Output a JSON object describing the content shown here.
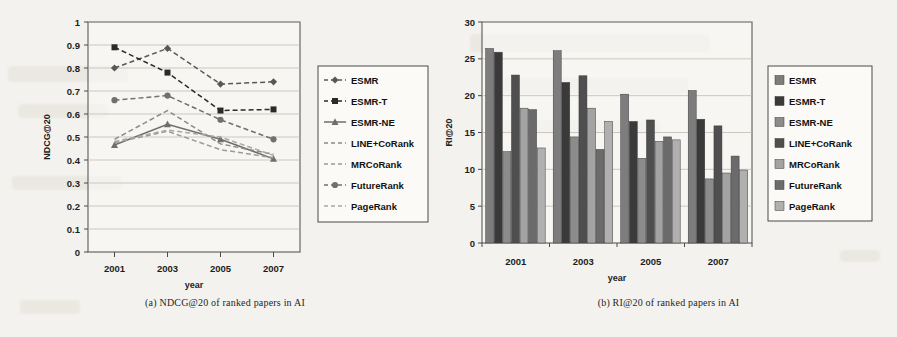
{
  "figure": {
    "panels": [
      {
        "id": "panel-a",
        "caption": "(a) NDCG@20  of ranked  papers in AI",
        "chart_ref": 0
      },
      {
        "id": "panel-b",
        "caption": "(b) RI@20  of ranked  papers in AI",
        "chart_ref": 1
      }
    ]
  },
  "chart_data": [
    {
      "type": "line",
      "title": "",
      "xlabel": "year",
      "ylabel": "NDCG@20",
      "categories": [
        "2001",
        "2003",
        "2005",
        "2007"
      ],
      "ylim": [
        0,
        1
      ],
      "yticks": [
        "0",
        "0.1",
        "0.2",
        "0.3",
        "0.4",
        "0.5",
        "0.6",
        "0.7",
        "0.8",
        "0.9",
        "1"
      ],
      "grid": true,
      "legend_position": "right",
      "series": [
        {
          "name": "ESMR",
          "values": [
            0.8,
            0.885,
            0.73,
            0.74
          ],
          "marker": "diamond",
          "dash": "dashed",
          "color": "#585858"
        },
        {
          "name": "ESMR-T",
          "values": [
            0.89,
            0.78,
            0.615,
            0.62
          ],
          "marker": "square",
          "dash": "dashed",
          "color": "#2a2a2a"
        },
        {
          "name": "ESMR-NE",
          "values": [
            0.465,
            0.555,
            0.49,
            0.405
          ],
          "marker": "triangle",
          "dash": "solid",
          "color": "#6e6e6e"
        },
        {
          "name": "LINE+CoRank",
          "values": [
            0.49,
            0.615,
            0.47,
            0.425
          ],
          "marker": "none",
          "dash": "dashed",
          "color": "#8a8a8a"
        },
        {
          "name": "MRCoRank",
          "values": [
            0.475,
            0.525,
            0.445,
            0.41
          ],
          "marker": "none",
          "dash": "dashed",
          "color": "#9b9b9b"
        },
        {
          "name": "FutureRank",
          "values": [
            0.66,
            0.68,
            0.575,
            0.49
          ],
          "marker": "circle",
          "dash": "dashed",
          "color": "#707070"
        },
        {
          "name": "PageRank",
          "values": [
            0.48,
            0.53,
            0.5,
            0.42
          ],
          "marker": "none",
          "dash": "dashed",
          "color": "#a8a8a8"
        }
      ]
    },
    {
      "type": "bar",
      "title": "",
      "xlabel": "year",
      "ylabel": "RI@20",
      "categories": [
        "2001",
        "2003",
        "2005",
        "2007"
      ],
      "ylim": [
        0,
        30
      ],
      "yticks": [
        "0",
        "5",
        "10",
        "15",
        "20",
        "25",
        "30"
      ],
      "grid": true,
      "legend_position": "right",
      "series": [
        {
          "name": "ESMR",
          "values": [
            26.4,
            26.1,
            20.2,
            20.7
          ],
          "color": "#7d7d7d"
        },
        {
          "name": "ESMR-T",
          "values": [
            25.9,
            21.8,
            16.5,
            16.8
          ],
          "color": "#3a3a3a"
        },
        {
          "name": "ESMR-NE",
          "values": [
            12.4,
            14.4,
            11.5,
            8.7
          ],
          "color": "#8c8c8c"
        },
        {
          "name": "LINE+CoRank",
          "values": [
            22.8,
            22.7,
            16.7,
            15.9
          ],
          "color": "#4f4f4f"
        },
        {
          "name": "MRCoRank",
          "values": [
            18.3,
            18.3,
            13.8,
            9.5
          ],
          "color": "#a3a3a3"
        },
        {
          "name": "FutureRank",
          "values": [
            18.1,
            12.7,
            14.4,
            11.8
          ],
          "color": "#6b6b6b"
        },
        {
          "name": "PageRank",
          "values": [
            12.9,
            16.5,
            14.0,
            9.9
          ],
          "color": "#b0b0b0"
        }
      ]
    }
  ],
  "colors": {
    "page_background": "#f3f2ee",
    "axis": "#4a4a4a",
    "grid": "#b9b4aa",
    "text": "#1d1d1d"
  }
}
